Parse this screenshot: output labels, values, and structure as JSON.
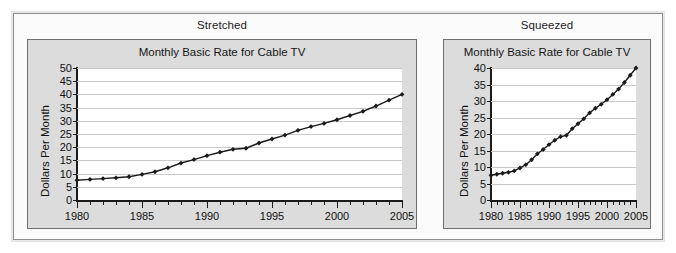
{
  "figure": {
    "panels": [
      {
        "key": "stretched",
        "panel_label": "Stretched",
        "chart_title": "Monthly Basic Rate for Cable TV",
        "ylabel": "Dollars Per Month"
      },
      {
        "key": "squeezed",
        "panel_label": "Squeezed",
        "chart_title": "Monthly Basic Rate for Cable TV",
        "ylabel": "Dollars Per Month"
      }
    ],
    "colors": {
      "figure_background": "#fbfbfb",
      "figure_border": "#8e8e8e",
      "chart_background": "#dcdcdc",
      "chart_border": "#6f6f6f",
      "plot_background": "#ffffff",
      "gridline": "#c9c9c9",
      "axis": "#1a1a1a",
      "series_line": "#1a1a1a",
      "series_marker": "#1a1a1a",
      "text": "#111111"
    }
  },
  "chart_data": [
    {
      "type": "line",
      "key": "stretched",
      "title": "Monthly Basic Rate for Cable TV",
      "xlabel": "",
      "ylabel": "Dollars Per Month",
      "xlim": [
        1980,
        2005
      ],
      "ylim": [
        0,
        50
      ],
      "ytick_labels": [
        "0",
        "5",
        "10",
        "15",
        "20",
        "25",
        "30",
        "35",
        "40",
        "45",
        "50"
      ],
      "ytick_values": [
        0,
        5,
        10,
        15,
        20,
        25,
        30,
        35,
        40,
        45,
        50
      ],
      "xtick_labels": [
        "1980",
        "1985",
        "1990",
        "1995",
        "2000",
        "2005"
      ],
      "xtick_values": [
        1980,
        1985,
        1990,
        1995,
        2000,
        2005
      ],
      "minor_xticks_every": 1,
      "grid": "horizontal",
      "legend": "none",
      "markers": "diamond",
      "x": [
        1980,
        1981,
        1982,
        1983,
        1984,
        1985,
        1986,
        1987,
        1988,
        1989,
        1990,
        1991,
        1992,
        1993,
        1994,
        1995,
        1996,
        1997,
        1998,
        1999,
        2000,
        2001,
        2002,
        2003,
        2004,
        2005
      ],
      "values": [
        7.5,
        7.8,
        8.1,
        8.4,
        8.8,
        9.7,
        10.7,
        12.2,
        14.0,
        15.3,
        16.8,
        18.1,
        19.2,
        19.6,
        21.6,
        23.1,
        24.6,
        26.4,
        27.8,
        29.0,
        30.4,
        32.0,
        33.6,
        35.6,
        37.8,
        40.0
      ]
    },
    {
      "type": "line",
      "key": "squeezed",
      "title": "Monthly Basic Rate for Cable TV",
      "xlabel": "",
      "ylabel": "Dollars Per Month",
      "xlim": [
        1980,
        2005
      ],
      "ylim": [
        0,
        40
      ],
      "ytick_labels": [
        "0",
        "5",
        "10",
        "15",
        "20",
        "25",
        "30",
        "35",
        "40"
      ],
      "ytick_values": [
        0,
        5,
        10,
        15,
        20,
        25,
        30,
        35,
        40
      ],
      "xtick_labels": [
        "1980",
        "1985",
        "1990",
        "1995",
        "2000",
        "2005"
      ],
      "xtick_values": [
        1980,
        1985,
        1990,
        1995,
        2000,
        2005
      ],
      "minor_xticks_every": 1,
      "grid": "horizontal",
      "legend": "none",
      "markers": "diamond",
      "x": [
        1980,
        1981,
        1982,
        1983,
        1984,
        1985,
        1986,
        1987,
        1988,
        1989,
        1990,
        1991,
        1992,
        1993,
        1994,
        1995,
        1996,
        1997,
        1998,
        1999,
        2000,
        2001,
        2002,
        2003,
        2004,
        2005
      ],
      "values": [
        7.5,
        7.8,
        8.1,
        8.4,
        8.8,
        9.7,
        10.7,
        12.2,
        14.0,
        15.3,
        16.8,
        18.1,
        19.2,
        19.6,
        21.6,
        23.1,
        24.6,
        26.4,
        27.8,
        29.0,
        30.4,
        32.0,
        33.6,
        35.6,
        37.8,
        40.0
      ]
    }
  ]
}
